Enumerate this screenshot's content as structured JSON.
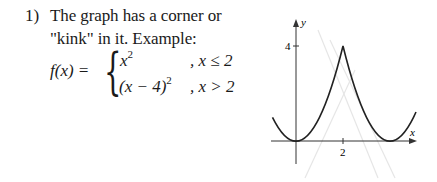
{
  "item": {
    "number": "1)",
    "line1": "The graph has a corner or",
    "line2": "\"kink\" in it. Example:"
  },
  "function": {
    "lhs": "f(x) = ",
    "pieces": [
      {
        "expr_base": "x",
        "expr_exp": "2",
        "expr_prefix": "",
        "condition": ", x ≤ 2"
      },
      {
        "expr_base": "(x − 4)",
        "expr_exp": "2",
        "expr_prefix": "",
        "condition": ", x > 2"
      }
    ]
  },
  "graph": {
    "x_axis_label": "x",
    "y_axis_label": "y",
    "x_tick_label": "2",
    "y_tick_label": "4",
    "curve_color": "#222222",
    "axis_color": "#333333"
  }
}
